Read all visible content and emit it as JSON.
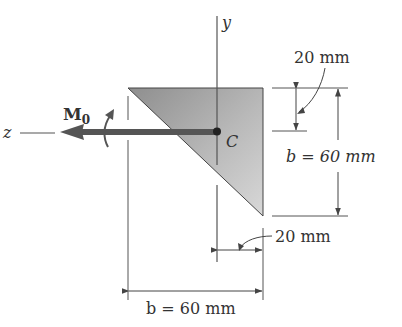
{
  "figure": {
    "axes": {
      "y_label": "y",
      "z_label": "z"
    },
    "moment": {
      "symbol": "M",
      "subscript": "0"
    },
    "centroid": {
      "label": "C"
    },
    "dimensions": {
      "top_offset": "20 mm",
      "height": "b = 60 mm",
      "right_offset": "20 mm",
      "width": "b = 60 mm"
    },
    "colors": {
      "line": "#555555",
      "shape_fill_light": "#d2d2d2",
      "shape_fill_dark": "#8c8c8c",
      "arrow": "#555555",
      "text": "#333333"
    }
  }
}
